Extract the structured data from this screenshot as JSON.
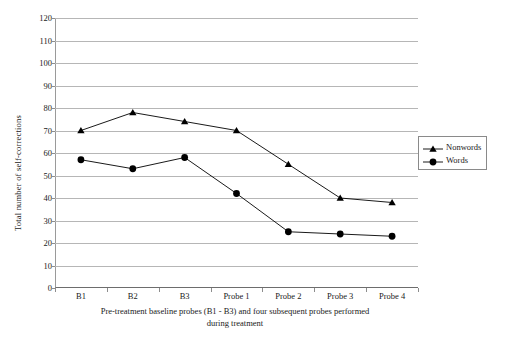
{
  "chart_data": {
    "type": "line",
    "title": "",
    "subtitle": "",
    "categories": [
      "B1",
      "B2",
      "B3",
      "Probe 1",
      "Probe 2",
      "Probe 3",
      "Probe 4"
    ],
    "series": [
      {
        "name": "Nonwords",
        "marker": "triangle",
        "color": "#000000",
        "values": [
          70,
          78,
          74,
          70,
          55,
          40,
          38
        ]
      },
      {
        "name": "Words",
        "marker": "circle",
        "color": "#000000",
        "values": [
          57,
          53,
          58,
          42,
          25,
          24,
          23
        ]
      }
    ],
    "xlabel": "Pre-treatment baseline probes (B1 - B3) and four subsequent probes performed during treatment",
    "ylabel": "Total number of self-corrections",
    "ylim": [
      0,
      120
    ],
    "ytick_step": 10,
    "yticks": [
      0,
      10,
      20,
      30,
      40,
      50,
      60,
      70,
      80,
      90,
      100,
      110,
      120
    ],
    "grid": true,
    "grid_color": "#b6b6b6",
    "legend_position": "right",
    "legend_entries": [
      "Nonwords",
      "Words"
    ]
  },
  "axis": {
    "y_title": "Total number of self-corrections",
    "x_title_line1": "Pre-treatment baseline probes (B1 - B3) and four subsequent probes performed",
    "x_title_line2": "during treatment"
  },
  "legend": {
    "items": [
      {
        "label": "Nonwords",
        "marker": "triangle-marker-icon"
      },
      {
        "label": "Words",
        "marker": "circle-marker-icon"
      }
    ]
  }
}
